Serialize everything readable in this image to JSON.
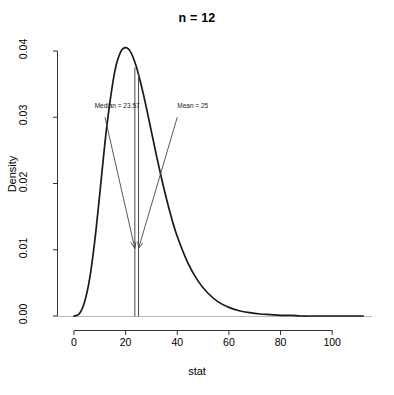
{
  "chart_data": {
    "type": "line",
    "title": "n = 12",
    "xlabel": "stat",
    "ylabel": "Density",
    "xlim": [
      -4,
      114
    ],
    "ylim": [
      0,
      0.0425
    ],
    "grid": false,
    "legend": null,
    "x_ticks": [
      0,
      20,
      40,
      60,
      80,
      100
    ],
    "x_tick_labels": [
      "0",
      "20",
      "40",
      "60",
      "80",
      "100"
    ],
    "y_ticks": [
      0.0,
      0.01,
      0.02,
      0.03,
      0.04
    ],
    "y_tick_labels": [
      "0.00",
      "0.01",
      "0.02",
      "0.03",
      "0.04"
    ],
    "series": [
      {
        "name": "density",
        "x": [
          0,
          2,
          4,
          6,
          8,
          10,
          12,
          14,
          16,
          18,
          20,
          22,
          24,
          26,
          28,
          30,
          32,
          34,
          36,
          38,
          40,
          44,
          48,
          52,
          56,
          60,
          64,
          68,
          72,
          76,
          80,
          84,
          88,
          92,
          96,
          100,
          104,
          108,
          112
        ],
        "y": [
          0.0,
          0.0003,
          0.002,
          0.0055,
          0.0112,
          0.0185,
          0.0262,
          0.0325,
          0.0373,
          0.0398,
          0.0405,
          0.0398,
          0.0378,
          0.0349,
          0.0315,
          0.0278,
          0.0241,
          0.0206,
          0.0174,
          0.0145,
          0.012,
          0.0081,
          0.0053,
          0.0034,
          0.0021,
          0.0013,
          0.0008,
          0.0005,
          0.0003,
          0.0002,
          0.0001,
          0.0001,
          0.0,
          0.0,
          0.0,
          0.0,
          0.0,
          0.0,
          0.0
        ]
      }
    ],
    "vlines": [
      {
        "name": "median",
        "x": 23.57,
        "y_top": 0.0375
      },
      {
        "name": "mean",
        "x": 25.0,
        "y_top": 0.0365
      }
    ],
    "annotations": [
      {
        "name": "median",
        "text": "Median = 23.57",
        "label_x": 8,
        "label_y": 0.0316,
        "arrow_from_x": 12,
        "arrow_from_y": 0.03,
        "arrow_to_x": 23.57,
        "arrow_to_y": 0.0102
      },
      {
        "name": "mean",
        "text": "Mean = 25",
        "label_x": 40,
        "label_y": 0.0316,
        "arrow_from_x": 40,
        "arrow_from_y": 0.03,
        "arrow_to_x": 25.0,
        "arrow_to_y": 0.0102
      }
    ],
    "colors": {
      "curve": "#1a1a1a",
      "axis": "#333333",
      "annotation": "#444444",
      "background": "#ffffff"
    }
  }
}
